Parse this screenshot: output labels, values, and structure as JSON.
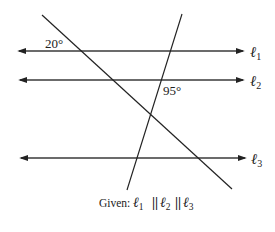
{
  "diagram": {
    "angles": {
      "angle_1": {
        "label": "20°"
      },
      "angle_2": {
        "label": "95°"
      }
    },
    "lines": {
      "l1": {
        "symbol": "ℓ",
        "sub": "1"
      },
      "l2": {
        "symbol": "ℓ",
        "sub": "2"
      },
      "l3": {
        "symbol": "ℓ",
        "sub": "3"
      }
    },
    "given": {
      "prefix": "Given:",
      "parallel": "||",
      "l1": {
        "symbol": "ℓ",
        "sub": "1"
      },
      "l2": {
        "symbol": "ℓ",
        "sub": "2"
      },
      "l3": {
        "symbol": "ℓ",
        "sub": "3"
      }
    },
    "colors": {
      "line": "#222222",
      "parallel_line": "#3a3a3a"
    }
  }
}
